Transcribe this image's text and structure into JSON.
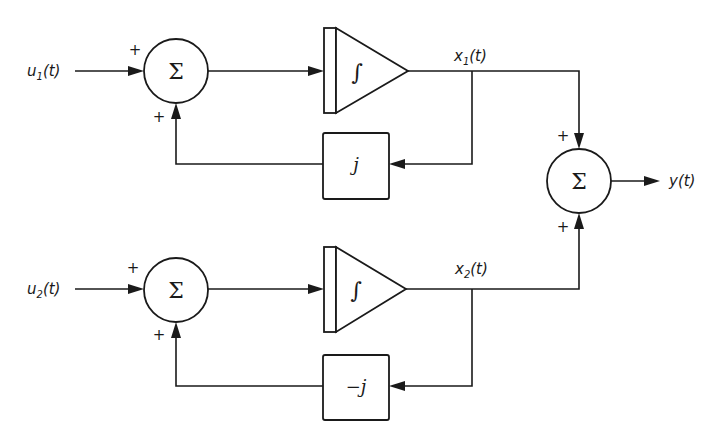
{
  "diagram": {
    "type": "block-diagram",
    "colors": {
      "line": "#1a1a1a",
      "background": "#ffffff"
    },
    "inputs": [
      {
        "id": "u1",
        "base": "u",
        "sub": "1",
        "arg": "(t)"
      },
      {
        "id": "u2",
        "base": "u",
        "sub": "2",
        "arg": "(t)"
      }
    ],
    "states": [
      {
        "id": "x1",
        "base": "x",
        "sub": "1",
        "arg": "(t)"
      },
      {
        "id": "x2",
        "base": "x",
        "sub": "2",
        "arg": "(t)"
      }
    ],
    "output": {
      "id": "y",
      "label": "y(t)"
    },
    "summing_junctions": [
      {
        "id": "sum1",
        "symbol": "Σ",
        "signs": [
          "+",
          "+"
        ]
      },
      {
        "id": "sum2",
        "symbol": "Σ",
        "signs": [
          "+",
          "+"
        ]
      },
      {
        "id": "sum_out",
        "symbol": "Σ",
        "signs": [
          "+",
          "+"
        ]
      }
    ],
    "integrators": [
      {
        "id": "int1",
        "symbol": "∫"
      },
      {
        "id": "int2",
        "symbol": "∫"
      }
    ],
    "gains": [
      {
        "id": "gain1",
        "label": "j"
      },
      {
        "id": "gain2",
        "label": "−j"
      }
    ]
  }
}
